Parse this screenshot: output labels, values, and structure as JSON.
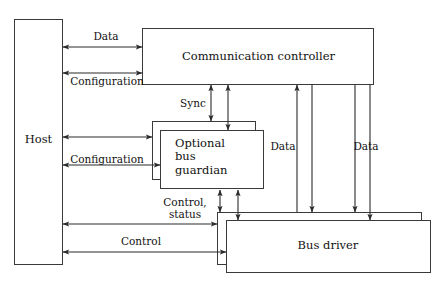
{
  "figure": {
    "kind": "block-diagram",
    "title": "",
    "stroke_color": "#3a3a3a",
    "text_color": "#111111",
    "background": "#ffffff"
  },
  "blocks": [
    {
      "id": "host",
      "label": "Host",
      "stacked": false
    },
    {
      "id": "communication_controller",
      "label": "Communication controller",
      "stacked": false
    },
    {
      "id": "optional_bus_guardian",
      "label": "Optional\nbus\nguardian",
      "stacked": true
    },
    {
      "id": "bus_driver",
      "label": "Bus driver",
      "stacked": true
    }
  ],
  "edges": [
    {
      "id": "host_cc_data",
      "label": "Data",
      "from": "host",
      "to": "communication_controller",
      "direction": "bidirectional",
      "orientation": "horizontal"
    },
    {
      "id": "host_cc_config",
      "label": "Configuration",
      "from": "host",
      "to": "communication_controller",
      "direction": "bidirectional",
      "orientation": "horizontal"
    },
    {
      "id": "cc_guardian_sync",
      "label": "Sync",
      "from": "communication_controller",
      "to": "optional_bus_guardian",
      "direction": "bidirectional",
      "orientation": "vertical"
    },
    {
      "id": "host_guardian_config",
      "label": "Configuration",
      "from": "host",
      "to": "optional_bus_guardian",
      "direction": "bidirectional",
      "orientation": "horizontal"
    },
    {
      "id": "guardian_busdriver_ctrlstatus",
      "label": "Control,\nstatus",
      "from": "optional_bus_guardian",
      "to": "bus_driver",
      "direction": "bidirectional",
      "orientation": "vertical"
    },
    {
      "id": "host_busdriver_control",
      "label": "Control",
      "from": "host",
      "to": "bus_driver",
      "direction": "bidirectional",
      "orientation": "horizontal"
    },
    {
      "id": "cc_busdriver_data_1",
      "label": "Data",
      "from": "communication_controller",
      "to": "bus_driver",
      "direction": "bidirectional",
      "orientation": "vertical"
    },
    {
      "id": "cc_busdriver_data_2",
      "label": "Data",
      "from": "communication_controller",
      "to": "bus_driver",
      "direction": "bidirectional",
      "orientation": "vertical"
    }
  ],
  "labels": {
    "host": "Host",
    "communication_controller": "Communication controller",
    "optional_bus_guardian": "Optional\nbus\nguardian",
    "bus_driver": "Bus driver",
    "data_top": "Data",
    "configuration_top": "Configuration",
    "sync": "Sync",
    "configuration_mid": "Configuration",
    "control_status": "Control,\nstatus",
    "control_bottom": "Control",
    "data_right_1": "Data",
    "data_right_2": "Data"
  }
}
